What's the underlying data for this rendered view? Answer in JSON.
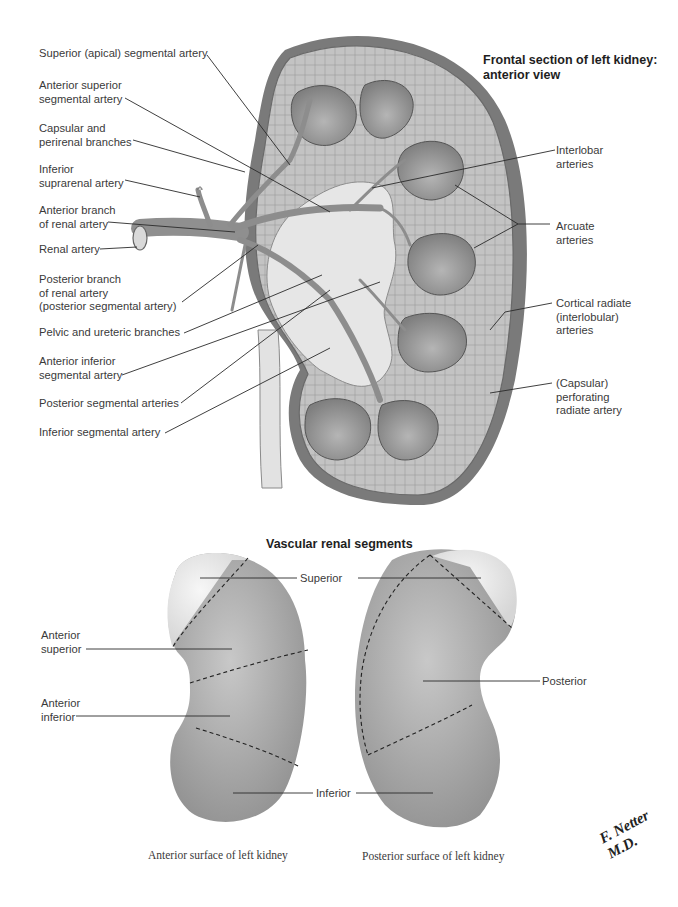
{
  "top_figure": {
    "title": "Frontal section of left kidney:\nanterior view",
    "left_labels": [
      {
        "id": "superior-apical",
        "text": "Superior (apical) segmental artery"
      },
      {
        "id": "anterior-superior",
        "text": "Anterior superior\nsegmental artery"
      },
      {
        "id": "capsular-perirenal",
        "text": "Capsular and\nperirenal branches"
      },
      {
        "id": "inferior-suprarenal",
        "text": "Inferior\nsuprarenal artery"
      },
      {
        "id": "anterior-branch",
        "text": "Anterior branch\nof renal artery"
      },
      {
        "id": "renal-artery",
        "text": "Renal artery"
      },
      {
        "id": "posterior-branch",
        "text": "Posterior branch\nof renal artery\n(posterior segmental artery)"
      },
      {
        "id": "pelvic-ureteric",
        "text": "Pelvic and ureteric branches"
      },
      {
        "id": "anterior-inferior",
        "text": "Anterior inferior\nsegmental artery"
      },
      {
        "id": "posterior-segmental",
        "text": "Posterior segmental arteries"
      },
      {
        "id": "inferior-segmental",
        "text": "Inferior segmental artery"
      }
    ],
    "right_labels": [
      {
        "id": "interlobar",
        "text": "Interlobar\narteries"
      },
      {
        "id": "arcuate",
        "text": "Arcuate\narteries"
      },
      {
        "id": "cortical-radiate",
        "text": "Cortical radiate\n(interlobular)\narteries"
      },
      {
        "id": "capsular-perforating",
        "text": "(Capsular)\nperforating\nradiate artery"
      }
    ]
  },
  "bottom_figure": {
    "title": "Vascular renal segments",
    "segment_labels": {
      "superior": "Superior",
      "anterior_superior": "Anterior\nsuperior",
      "anterior_inferior": "Anterior\ninferior",
      "posterior": "Posterior",
      "inferior": "Inferior"
    },
    "captions": {
      "anterior": "Anterior surface of left kidney",
      "posterior": "Posterior surface of left kidney"
    }
  },
  "signature": "F. Netter M.D.",
  "colors": {
    "background": "#ffffff",
    "text": "#3a3a3a",
    "leader_line": "#2a2a2a",
    "capsule": "#6e6e6e",
    "cortex": "#b9b9b9",
    "pyramid": "#9a9a9a",
    "pelvis": "#e4e4e4",
    "segment_light": "#e9e9e9",
    "segment_dark": "#a8a8a8"
  }
}
